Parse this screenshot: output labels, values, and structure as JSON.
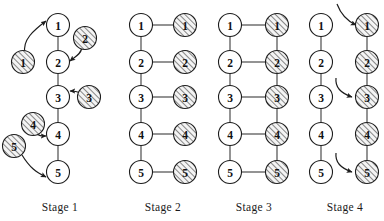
{
  "figure": {
    "title": "",
    "node_labels": [
      "1",
      "2",
      "3",
      "4",
      "5"
    ],
    "stages": [
      {
        "id": "stage-1",
        "label": "Stage 1",
        "label_x": 60,
        "label_y": 211,
        "chain_x": 58,
        "loose_nodes": [
          {
            "label": "1",
            "x": 23,
            "y": 62
          },
          {
            "label": "2",
            "x": 85,
            "y": 38
          },
          {
            "label": "3",
            "x": 89,
            "y": 97
          },
          {
            "label": "4",
            "x": 33,
            "y": 124
          },
          {
            "label": "5",
            "x": 14,
            "y": 146
          }
        ],
        "chain_nodes": [
          {
            "label": "1",
            "x": 58,
            "y": 25
          },
          {
            "label": "2",
            "x": 58,
            "y": 62
          },
          {
            "label": "3",
            "x": 58,
            "y": 97
          },
          {
            "label": "4",
            "x": 58,
            "y": 134
          },
          {
            "label": "5",
            "x": 58,
            "y": 172
          }
        ],
        "arrows": [
          {
            "from": [
              25,
              53
            ],
            "c1": [
              22,
              40
            ],
            "c2": [
              34,
              30
            ],
            "to": [
              46,
              21
            ]
          },
          {
            "from": [
              82,
              48
            ],
            "c1": [
              80,
              55
            ],
            "c2": [
              76,
              56
            ],
            "to": [
              70,
              61
            ]
          },
          {
            "from": [
              81,
              93
            ],
            "c1": [
              76,
              91
            ],
            "c2": [
              74,
              91
            ],
            "to": [
              70,
              91
            ]
          },
          {
            "from": [
              36,
              133
            ],
            "c1": [
              39,
              136
            ],
            "c2": [
              41,
              136
            ],
            "to": [
              46,
              136
            ]
          },
          {
            "from": [
              22,
              155
            ],
            "c1": [
              30,
              168
            ],
            "c2": [
              36,
              172
            ],
            "to": [
              46,
              177
            ]
          }
        ]
      },
      {
        "id": "stage-2",
        "label": "Stage 2",
        "label_x": 163,
        "label_y": 211,
        "left_x": 141,
        "right_x": 185,
        "left_vertical": true,
        "right_vertical": false,
        "rungs": [
          1,
          2,
          3,
          4,
          5
        ],
        "arrows": []
      },
      {
        "id": "stage-3",
        "label": "Stage 3",
        "label_x": 254,
        "label_y": 211,
        "left_x": 230,
        "right_x": 277,
        "left_vertical": true,
        "right_vertical": true,
        "rungs": [
          1,
          2,
          3,
          4,
          5
        ],
        "arrows": []
      },
      {
        "id": "stage-4",
        "label": "Stage 4",
        "label_x": 345,
        "label_y": 211,
        "left_x": 321,
        "right_x": 367,
        "left_vertical": true,
        "right_vertical": true,
        "rungs": [],
        "arrows": [
          {
            "from": [
              337,
              4
            ],
            "c1": [
              340,
              12
            ],
            "c2": [
              345,
              20
            ],
            "to": [
              356,
              25
            ]
          },
          {
            "from": [
              336,
              78
            ],
            "c1": [
              335,
              87
            ],
            "c2": [
              340,
              93
            ],
            "to": [
              352,
              97
            ]
          },
          {
            "from": [
              336,
              153
            ],
            "c1": [
              335,
              162
            ],
            "c2": [
              340,
              168
            ],
            "to": [
              352,
              172
            ]
          }
        ]
      }
    ],
    "row_y": [
      25,
      62,
      97,
      134,
      172
    ],
    "node_radius": 11.5,
    "colors": {
      "background": "#ffffff",
      "stroke": "#1c1c1c",
      "edge": "#3b3b3b",
      "text": "#111111",
      "hatch": "#2a2a2a",
      "shade_fill": "#f2f2f2"
    }
  }
}
